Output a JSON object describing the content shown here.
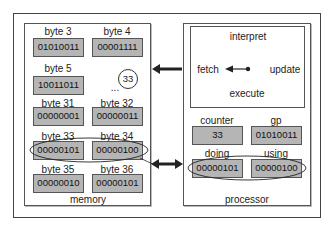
{
  "memory": {
    "title": "memory",
    "bytes": [
      {
        "label": "byte 3",
        "value": "01010011"
      },
      {
        "label": "byte 4",
        "value": "00001111"
      },
      {
        "label": "byte 5",
        "value": "10011011"
      },
      {
        "label": "byte 31",
        "value": "00000001"
      },
      {
        "label": "byte 32",
        "value": "00000011"
      },
      {
        "label": "byte 33",
        "value": "00000101"
      },
      {
        "label": "byte 34",
        "value": "00000100"
      },
      {
        "label": "byte 35",
        "value": "00000010"
      },
      {
        "label": "byte 36",
        "value": "00000101"
      }
    ],
    "ellipsis": "...",
    "address_marker": "33"
  },
  "processor": {
    "title": "processor",
    "cycle": {
      "interpret": "interpret",
      "fetch": "fetch",
      "update": "update",
      "execute": "execute"
    },
    "registers": [
      {
        "label": "counter",
        "value": "33"
      },
      {
        "label": "gp",
        "value": "01010011"
      },
      {
        "label": "doing",
        "value": "00000101"
      },
      {
        "label": "using",
        "value": "00000100"
      }
    ]
  }
}
